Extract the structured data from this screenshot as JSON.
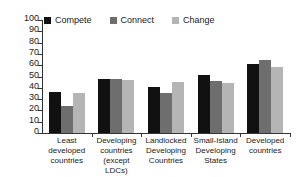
{
  "chart_data": {
    "type": "bar",
    "title": "",
    "subtitle": "",
    "xlabel": "",
    "ylabel": "",
    "ylim": [
      0,
      100
    ],
    "yticks": [
      0,
      10,
      20,
      30,
      40,
      50,
      60,
      70,
      80,
      90,
      100
    ],
    "grid": false,
    "legend_position": "top-left",
    "categories": [
      "Least developed countries",
      "Developing countries (except LDCs)",
      "Landlocked Developing Countries",
      "Small-Island Developing States",
      "Developed countries"
    ],
    "category_lines": [
      [
        "Least",
        "developed",
        "countries"
      ],
      [
        "Developing",
        "countries",
        "(except LDCs)"
      ],
      [
        "Landlocked",
        "Developing",
        "Countries"
      ],
      [
        "Small-Island",
        "Developing",
        "States"
      ],
      [
        "Developed",
        "countries"
      ]
    ],
    "series": [
      {
        "name": "Compete",
        "color": "#111111",
        "values": [
          36.5,
          48.0,
          41.0,
          51.5,
          61.5
        ]
      },
      {
        "name": "Connect",
        "color": "#6e6e6e",
        "values": [
          24.0,
          48.0,
          35.5,
          46.0,
          64.5
        ]
      },
      {
        "name": "Change",
        "color": "#b5b5b5",
        "values": [
          35.5,
          47.0,
          45.5,
          44.0,
          58.0
        ]
      }
    ]
  },
  "legend": {
    "items": [
      {
        "label": "Compete",
        "color": "#111111",
        "icon": "square-swatch-icon"
      },
      {
        "label": "Connect",
        "color": "#6e6e6e",
        "icon": "square-swatch-icon"
      },
      {
        "label": "Change",
        "color": "#b5b5b5",
        "icon": "square-swatch-icon"
      }
    ]
  },
  "axis": {
    "y_tick_labels": [
      "100",
      "90",
      "80",
      "70",
      "60",
      "50",
      "40",
      "30",
      "20",
      "10",
      "0"
    ]
  },
  "colors": {
    "axis": "#333333",
    "text": "#1a1a1a",
    "background": "#ffffff"
  }
}
